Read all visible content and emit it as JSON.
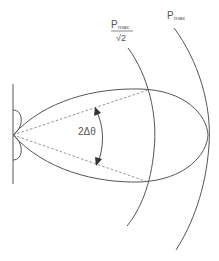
{
  "diagram": {
    "type": "antenna-radiation-pattern",
    "labels": {
      "half_power_numerator": "P",
      "half_power_numerator_sub": "max",
      "half_power_denominator": "√2",
      "max_power": "P",
      "max_power_sub": "max",
      "beamwidth": "2Δθ"
    },
    "colors": {
      "stroke": "#555555",
      "dash": "#777777",
      "background": "#ffffff"
    }
  }
}
